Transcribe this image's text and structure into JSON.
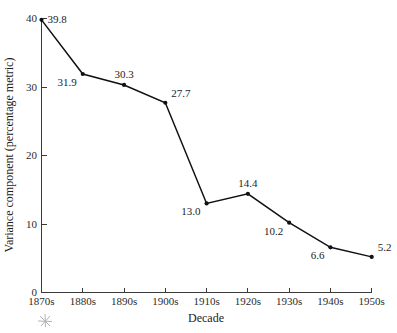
{
  "chart_data": {
    "type": "line",
    "title": "",
    "xlabel": "Decade",
    "ylabel": "Variance component (percentage metric)",
    "categories": [
      "1870s",
      "1880s",
      "1890s",
      "1900s",
      "1910s",
      "1920s",
      "1930s",
      "1940s",
      "1950s"
    ],
    "values": [
      39.8,
      31.9,
      30.3,
      27.7,
      13.0,
      14.4,
      10.2,
      6.6,
      5.2
    ],
    "point_labels": [
      "39.8",
      "31.9",
      "30.3",
      "27.7",
      "13.0",
      "14.4",
      "10.2",
      "6.6",
      "5.2"
    ],
    "label_positions": [
      "right",
      "below-left",
      "above",
      "above-right",
      "below-left",
      "above",
      "below-left",
      "below-left",
      "above-right"
    ],
    "ylim": [
      0,
      40
    ],
    "y_ticks": [
      0,
      10,
      20,
      30,
      40
    ],
    "y_tick_labels": [
      "0",
      "10",
      "20",
      "30",
      "40"
    ],
    "x_tick_labels": [
      "1870s",
      "1880s",
      "1890s",
      "1900s",
      "1910s",
      "1920s",
      "1930s",
      "1940s",
      "1950s"
    ],
    "grid": false,
    "legend": false,
    "legend_position": "none",
    "marker": "filled-circle",
    "line_color": "#111111",
    "axis_color": "#3a3a3a",
    "background_color": "#ffffff"
  },
  "figure": {
    "artifact_name": "scan-artifact-mark"
  }
}
